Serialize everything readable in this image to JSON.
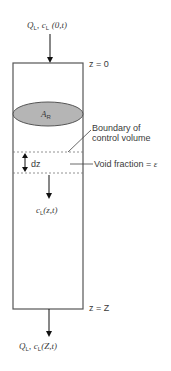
{
  "diagram": {
    "inlet_label": {
      "q": "Q",
      "q_sub": "L",
      "c": "c",
      "c_sub": "L",
      "arg": "(0,t)"
    },
    "outlet_label": {
      "q": "Q",
      "q_sub": "L",
      "c": "c",
      "c_sub": "L",
      "arg": "(Z,t)"
    },
    "top_position_label": "z = 0",
    "bottom_position_label": "z = Z",
    "area_label": {
      "main": "A",
      "sub": "R"
    },
    "differential_label": "dz",
    "concentration_label": {
      "c": "c",
      "c_sub": "L",
      "arg": "(z,t)"
    },
    "boundary_label_line1": "Boundary of",
    "boundary_label_line2": "control volume",
    "void_fraction_label": "Void fraction = ",
    "void_fraction_symbol": "ε",
    "colors": {
      "line": "#555555",
      "ellipse_fill": "#b5b5b5",
      "ellipse_stroke": "#555555",
      "dashed": "#777777",
      "arrow": "#111111"
    }
  }
}
